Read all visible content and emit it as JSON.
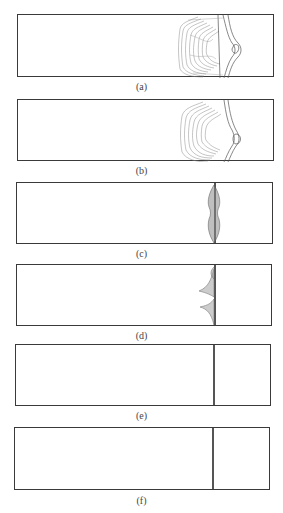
{
  "figure": {
    "panels": [
      {
        "id": "a",
        "label": "(a)",
        "content": "contour-field-wide"
      },
      {
        "id": "b",
        "label": "(b)",
        "content": "contour-field-wide"
      },
      {
        "id": "c",
        "label": "(c)",
        "content": "contour-narrow-band"
      },
      {
        "id": "d",
        "label": "(d)",
        "content": "contour-spikes"
      },
      {
        "id": "e",
        "label": "(e)",
        "content": "interface-line"
      },
      {
        "id": "f",
        "label": "(f)",
        "content": "interface-line"
      }
    ]
  },
  "colors": {
    "frame": "#3a3a3a",
    "contour": "#777777",
    "interface": "#555555"
  }
}
